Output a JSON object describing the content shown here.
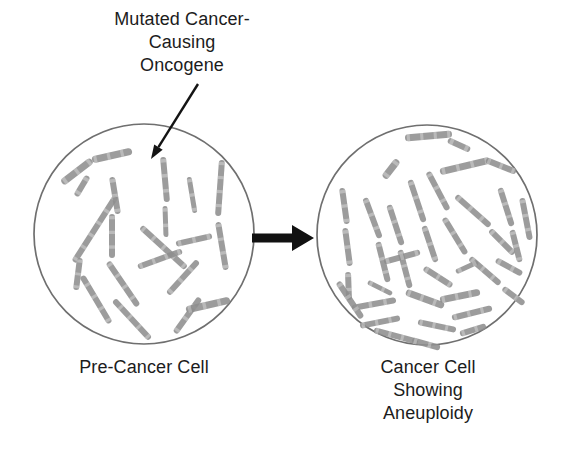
{
  "figure": {
    "background_color": "#ffffff",
    "annotation": {
      "label": "Mutated Cancer-\nCausing\nOncogene",
      "text_color": "#1c1c1c",
      "font_size_px": 18,
      "pointer": {
        "name": "annotation-pointer-arrow",
        "from_x": 198,
        "from_y": 84,
        "to_x": 151,
        "to_y": 159,
        "color": "#141414"
      }
    },
    "transition_arrow": {
      "name": "transition-arrow",
      "label": "",
      "from_x": 252,
      "to_x": 314,
      "y": 238,
      "color": "#111111"
    },
    "cells": [
      {
        "id": "pre-cancer-cell",
        "caption": "Pre-Cancer Cell",
        "center_x": 144,
        "center_y": 234,
        "radius": 110,
        "outline_color": "#6f6f6f",
        "chromosome_color": "#8e8e8e",
        "chromosome_count": 19
      },
      {
        "id": "cancer-cell",
        "caption": "Cancer Cell\nShowing\nAneuploidy",
        "center_x": 427,
        "center_y": 235,
        "radius": 110,
        "outline_color": "#6f6f6f",
        "chromosome_color": "#8e8e8e",
        "chromosome_count": 38
      }
    ]
  },
  "chart_data": {
    "type": "diagram",
    "categories": [
      "Pre-Cancer Cell",
      "Cancer Cell Showing Aneuploidy"
    ],
    "values": [
      19,
      38
    ],
    "ylabel": "Chromosome count",
    "annotations": [
      "Mutated Cancer-Causing Oncogene"
    ],
    "series": [
      {
        "name": "Pre-Cancer Cell",
        "chromosomes": [
          {
            "x1": 62,
            "y1": 183,
            "x2": 92,
            "y2": 160,
            "w": 7
          },
          {
            "x1": 92,
            "y1": 160,
            "x2": 132,
            "y2": 151,
            "w": 7
          },
          {
            "x1": 76,
            "y1": 196,
            "x2": 88,
            "y2": 176,
            "w": 6
          },
          {
            "x1": 74,
            "y1": 262,
            "x2": 116,
            "y2": 196,
            "w": 6
          },
          {
            "x1": 76,
            "y1": 290,
            "x2": 80,
            "y2": 258,
            "w": 6
          },
          {
            "x1": 110,
            "y1": 323,
            "x2": 82,
            "y2": 276,
            "w": 6
          },
          {
            "x1": 150,
            "y1": 339,
            "x2": 114,
            "y2": 300,
            "w": 6
          },
          {
            "x1": 112,
            "y1": 177,
            "x2": 118,
            "y2": 214,
            "w": 6
          },
          {
            "x1": 112,
            "y1": 214,
            "x2": 112,
            "y2": 258,
            "w": 6
          },
          {
            "x1": 108,
            "y1": 262,
            "x2": 138,
            "y2": 306,
            "w": 6
          },
          {
            "x1": 141,
            "y1": 227,
            "x2": 186,
            "y2": 268,
            "w": 6
          },
          {
            "x1": 163,
            "y1": 157,
            "x2": 167,
            "y2": 202,
            "w": 6
          },
          {
            "x1": 165,
            "y1": 206,
            "x2": 166,
            "y2": 237,
            "w": 5
          },
          {
            "x1": 168,
            "y1": 294,
            "x2": 198,
            "y2": 261,
            "w": 6
          },
          {
            "x1": 175,
            "y1": 333,
            "x2": 200,
            "y2": 298,
            "w": 6
          },
          {
            "x1": 189,
            "y1": 177,
            "x2": 195,
            "y2": 213,
            "w": 5
          },
          {
            "x1": 186,
            "y1": 310,
            "x2": 230,
            "y2": 300,
            "w": 7
          },
          {
            "x1": 222,
            "y1": 160,
            "x2": 218,
            "y2": 216,
            "w": 6
          },
          {
            "x1": 218,
            "y1": 222,
            "x2": 226,
            "y2": 270,
            "w": 6
          },
          {
            "x1": 138,
            "y1": 267,
            "x2": 182,
            "y2": 251,
            "w": 6
          },
          {
            "x1": 176,
            "y1": 244,
            "x2": 212,
            "y2": 236,
            "w": 6
          }
        ]
      },
      {
        "name": "Cancer Cell Showing Aneuploidy",
        "chromosomes": [
          {
            "x1": 405,
            "y1": 138,
            "x2": 452,
            "y2": 134,
            "w": 7
          },
          {
            "x1": 448,
            "y1": 140,
            "x2": 470,
            "y2": 150,
            "w": 6
          },
          {
            "x1": 398,
            "y1": 160,
            "x2": 384,
            "y2": 178,
            "w": 7
          },
          {
            "x1": 440,
            "y1": 172,
            "x2": 490,
            "y2": 160,
            "w": 7
          },
          {
            "x1": 486,
            "y1": 160,
            "x2": 516,
            "y2": 172,
            "w": 6
          },
          {
            "x1": 342,
            "y1": 188,
            "x2": 347,
            "y2": 224,
            "w": 6
          },
          {
            "x1": 345,
            "y1": 228,
            "x2": 350,
            "y2": 266,
            "w": 6
          },
          {
            "x1": 348,
            "y1": 272,
            "x2": 349,
            "y2": 300,
            "w": 6
          },
          {
            "x1": 365,
            "y1": 198,
            "x2": 380,
            "y2": 238,
            "w": 6
          },
          {
            "x1": 378,
            "y1": 242,
            "x2": 388,
            "y2": 282,
            "w": 6
          },
          {
            "x1": 389,
            "y1": 205,
            "x2": 402,
            "y2": 245,
            "w": 6
          },
          {
            "x1": 400,
            "y1": 250,
            "x2": 410,
            "y2": 288,
            "w": 6
          },
          {
            "x1": 410,
            "y1": 180,
            "x2": 424,
            "y2": 222,
            "w": 6
          },
          {
            "x1": 424,
            "y1": 226,
            "x2": 436,
            "y2": 262,
            "w": 6
          },
          {
            "x1": 428,
            "y1": 172,
            "x2": 448,
            "y2": 210,
            "w": 6
          },
          {
            "x1": 444,
            "y1": 218,
            "x2": 466,
            "y2": 254,
            "w": 6
          },
          {
            "x1": 456,
            "y1": 196,
            "x2": 490,
            "y2": 226,
            "w": 6
          },
          {
            "x1": 490,
            "y1": 230,
            "x2": 514,
            "y2": 254,
            "w": 6
          },
          {
            "x1": 500,
            "y1": 188,
            "x2": 512,
            "y2": 226,
            "w": 6
          },
          {
            "x1": 512,
            "y1": 230,
            "x2": 520,
            "y2": 262,
            "w": 6
          },
          {
            "x1": 522,
            "y1": 198,
            "x2": 530,
            "y2": 240,
            "w": 6
          },
          {
            "x1": 470,
            "y1": 258,
            "x2": 500,
            "y2": 284,
            "w": 6
          },
          {
            "x1": 503,
            "y1": 288,
            "x2": 524,
            "y2": 304,
            "w": 6
          },
          {
            "x1": 406,
            "y1": 292,
            "x2": 444,
            "y2": 306,
            "w": 7
          },
          {
            "x1": 440,
            "y1": 300,
            "x2": 480,
            "y2": 292,
            "w": 7
          },
          {
            "x1": 352,
            "y1": 308,
            "x2": 396,
            "y2": 300,
            "w": 6
          },
          {
            "x1": 360,
            "y1": 326,
            "x2": 400,
            "y2": 318,
            "w": 6
          },
          {
            "x1": 374,
            "y1": 330,
            "x2": 418,
            "y2": 342,
            "w": 6
          },
          {
            "x1": 418,
            "y1": 322,
            "x2": 456,
            "y2": 330,
            "w": 6
          },
          {
            "x1": 452,
            "y1": 318,
            "x2": 492,
            "y2": 308,
            "w": 6
          },
          {
            "x1": 338,
            "y1": 282,
            "x2": 362,
            "y2": 318,
            "w": 6
          },
          {
            "x1": 384,
            "y1": 262,
            "x2": 420,
            "y2": 252,
            "w": 6
          },
          {
            "x1": 424,
            "y1": 268,
            "x2": 452,
            "y2": 286,
            "w": 6
          },
          {
            "x1": 456,
            "y1": 272,
            "x2": 478,
            "y2": 262,
            "w": 5
          },
          {
            "x1": 496,
            "y1": 260,
            "x2": 522,
            "y2": 274,
            "w": 6
          },
          {
            "x1": 368,
            "y1": 282,
            "x2": 392,
            "y2": 294,
            "w": 5
          },
          {
            "x1": 412,
            "y1": 340,
            "x2": 440,
            "y2": 348,
            "w": 6
          },
          {
            "x1": 460,
            "y1": 334,
            "x2": 486,
            "y2": 326,
            "w": 6
          }
        ]
      }
    ]
  }
}
